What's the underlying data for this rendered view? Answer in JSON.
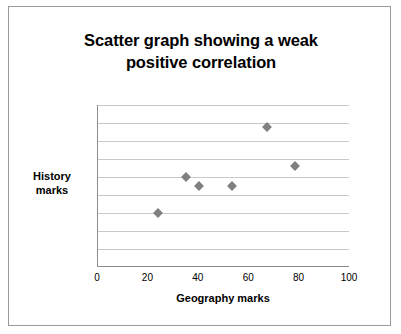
{
  "chart_data": {
    "type": "scatter",
    "title": "Scatter graph showing a weak positive correlation",
    "title_lines": [
      "Scatter graph showing a weak",
      "positive correlation"
    ],
    "xlabel": "Geography marks",
    "ylabel": "History marks",
    "ylabel_lines": [
      "History",
      "marks"
    ],
    "xlim": [
      0,
      100
    ],
    "ylim": [
      0,
      90
    ],
    "xticks": [
      0,
      20,
      40,
      60,
      80,
      100
    ],
    "yticks": [
      0,
      10,
      20,
      30,
      40,
      50,
      60,
      70,
      80,
      90
    ],
    "grid": "horizontal",
    "marker": "diamond",
    "marker_color": "#808080",
    "legend": "none",
    "points": [
      {
        "x": 24,
        "y": 30
      },
      {
        "x": 35,
        "y": 50
      },
      {
        "x": 40,
        "y": 45
      },
      {
        "x": 53,
        "y": 45
      },
      {
        "x": 67,
        "y": 78
      },
      {
        "x": 78,
        "y": 56
      }
    ]
  }
}
